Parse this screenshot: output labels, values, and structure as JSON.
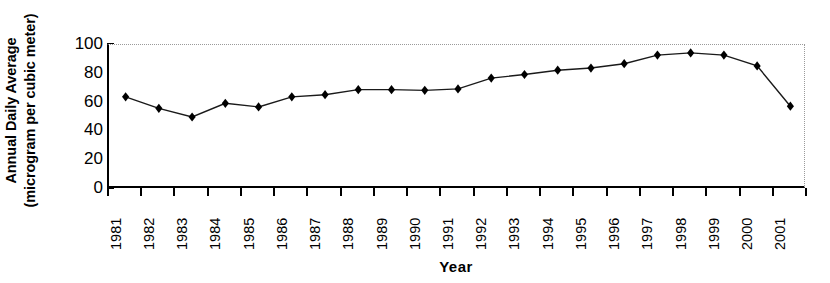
{
  "chart_data": {
    "type": "line",
    "title": "",
    "xlabel": "Year",
    "ylabel": "Annual Daily Average (microgram per cubic meter)",
    "ylabel_line1": "Annual Daily Average",
    "ylabel_line2": "(microgram per cubic meter)",
    "categories": [
      "1981",
      "1982",
      "1983",
      "1984",
      "1985",
      "1986",
      "1987",
      "1988",
      "1989",
      "1990",
      "1991",
      "1992",
      "1993",
      "1994",
      "1995",
      "1996",
      "1997",
      "1998",
      "1999",
      "2000",
      "2001"
    ],
    "values": [
      64,
      56,
      50,
      59.5,
      57,
      64,
      65.5,
      69,
      69,
      68.5,
      69.5,
      77,
      79.5,
      82.5,
      84,
      87,
      93,
      94.5,
      93,
      85.5,
      57.5
    ],
    "ylim": [
      0,
      100
    ],
    "yticks": [
      0,
      20,
      40,
      60,
      80,
      100
    ],
    "ytick_labels": [
      "0",
      "20",
      "40",
      "60",
      "80",
      "100"
    ],
    "grid": false,
    "legend": "none",
    "marker": "diamond",
    "marker_color": "#000000",
    "line_color": "#1a1a1a",
    "axis_color": "#000000",
    "frame_color": "#9a9a9a",
    "background": "#ffffff"
  }
}
